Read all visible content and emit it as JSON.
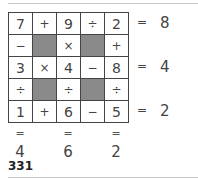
{
  "puzzle": {
    "grid": [
      [
        "7",
        "+",
        "9",
        "÷",
        "2"
      ],
      [
        "−",
        "",
        "×",
        "",
        "+"
      ],
      [
        "3",
        "×",
        "4",
        "−",
        "8"
      ],
      [
        "÷",
        "",
        "÷",
        "",
        "÷"
      ],
      [
        "1",
        "+",
        "6",
        "−",
        "5"
      ]
    ],
    "row_results": [
      {
        "eq": "=",
        "value": "8"
      },
      {
        "eq": "=",
        "value": "4"
      },
      {
        "eq": "=",
        "value": "2"
      }
    ],
    "col_results": [
      {
        "eq": "=",
        "value": "4"
      },
      {
        "eq": "=",
        "value": "6"
      },
      {
        "eq": "=",
        "value": "2"
      }
    ]
  },
  "page_number": "331"
}
